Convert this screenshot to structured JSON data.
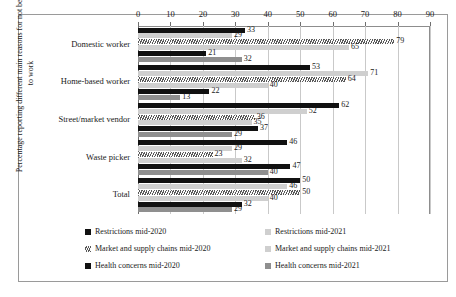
{
  "chart_data": {
    "type": "bar",
    "orientation": "horizontal",
    "title": "",
    "xlabel": "",
    "ylabel": "Percentage reporting different main reasons for not being able to work",
    "xlim": [
      0,
      90
    ],
    "xticks": [
      0,
      10,
      20,
      30,
      40,
      50,
      60,
      70,
      80,
      90
    ],
    "grid": true,
    "legend_position": "bottom",
    "categories": [
      "Domestic worker",
      "Home-based worker",
      "Street/market vendor",
      "Waste picker",
      "Total"
    ],
    "series": [
      {
        "name": "Restrictions mid-2020",
        "style": "black",
        "values": [
          33,
          53,
          62,
          46,
          50
        ]
      },
      {
        "name": "Restrictions mid-2021",
        "style": "lightgray",
        "values": [
          29,
          71,
          52,
          29,
          46
        ]
      },
      {
        "name": "Market and supply chains mid-2020",
        "style": "hatch",
        "values": [
          79,
          64,
          36,
          23,
          50
        ]
      },
      {
        "name": "Market and supply chains mid-2021",
        "style": "lightgray",
        "values": [
          65,
          40,
          35,
          32,
          40
        ]
      },
      {
        "name": "Health concerns mid-2020",
        "style": "black",
        "values": [
          21,
          22,
          37,
          47,
          32
        ]
      },
      {
        "name": "Health concerns mid-2021",
        "style": "midgray",
        "values": [
          32,
          13,
          29,
          40,
          29
        ]
      }
    ],
    "legend": [
      {
        "label": "Restrictions mid-2020",
        "style": "black"
      },
      {
        "label": "Restrictions mid-2021",
        "style": "lightgray"
      },
      {
        "label": "Market and supply chains mid-2020",
        "style": "hatch"
      },
      {
        "label": "Market and supply chains mid-2021",
        "style": "lightgray"
      },
      {
        "label": "Health concerns mid-2020",
        "style": "black"
      },
      {
        "label": "Health concerns mid-2021",
        "style": "midgray"
      }
    ]
  }
}
